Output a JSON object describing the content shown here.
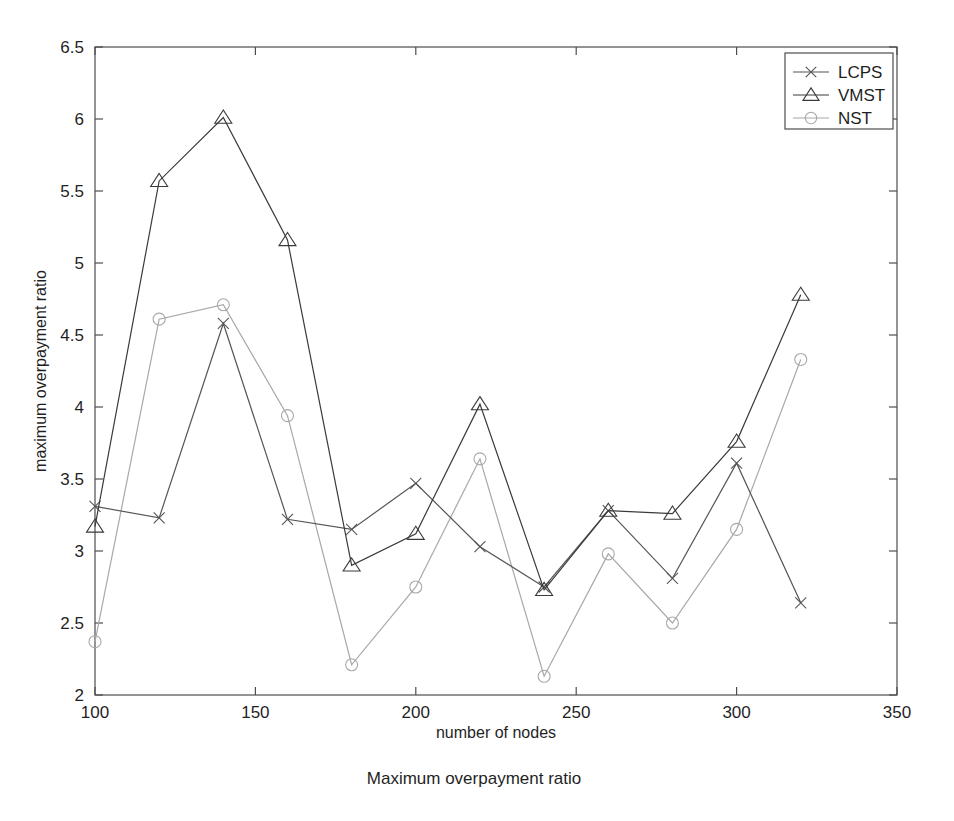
{
  "caption": "Maximum overpayment ratio",
  "axes": {
    "xlabel": "number of nodes",
    "ylabel": "maximum overpayment ratio",
    "xticks": [
      "100",
      "150",
      "200",
      "250",
      "300",
      "350"
    ],
    "yticks": [
      "2",
      "2.5",
      "3",
      "3.5",
      "4",
      "4.5",
      "5",
      "5.5",
      "6",
      "6.5"
    ]
  },
  "legend": {
    "items": [
      {
        "label": "LCPS",
        "marker": "x-marker-icon",
        "color": "#555555"
      },
      {
        "label": "VMST",
        "marker": "triangle-marker-icon",
        "color": "#3a3a3a"
      },
      {
        "label": "NST",
        "marker": "circle-marker-icon",
        "color": "#a8a8a8"
      }
    ]
  },
  "chart_data": {
    "type": "line",
    "title": "Maximum overpayment ratio",
    "xlabel": "number of nodes",
    "ylabel": "maximum overpayment ratio",
    "xlim": [
      100,
      350
    ],
    "ylim": [
      2,
      6.5
    ],
    "xticks": [
      100,
      150,
      200,
      250,
      300,
      350
    ],
    "yticks": [
      2,
      2.5,
      3,
      3.5,
      4,
      4.5,
      5,
      5.5,
      6,
      6.5
    ],
    "grid": false,
    "legend_position": "top-right",
    "x": [
      100,
      120,
      140,
      160,
      180,
      200,
      220,
      240,
      260,
      280,
      300,
      320
    ],
    "series": [
      {
        "name": "LCPS",
        "marker": "x",
        "color": "#555555",
        "values": [
          3.31,
          3.23,
          4.58,
          3.22,
          3.15,
          3.47,
          3.03,
          2.75,
          3.28,
          2.81,
          3.61,
          2.64
        ]
      },
      {
        "name": "VMST",
        "marker": "triangle",
        "color": "#3a3a3a",
        "values": [
          3.17,
          5.57,
          6.01,
          5.16,
          2.9,
          3.12,
          4.02,
          2.73,
          3.28,
          3.26,
          3.76,
          4.78
        ]
      },
      {
        "name": "NST",
        "marker": "circle",
        "color": "#a8a8a8",
        "values": [
          2.37,
          4.61,
          4.71,
          3.94,
          2.21,
          2.75,
          3.64,
          2.13,
          2.98,
          2.5,
          3.15,
          4.33
        ]
      }
    ]
  }
}
